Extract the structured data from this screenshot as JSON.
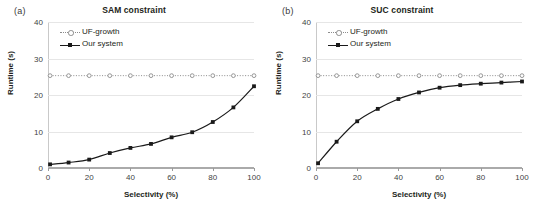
{
  "figure": {
    "panels": [
      {
        "tag": "(a)",
        "title": "SAM constraint",
        "legend": [
          {
            "label": "UF-growth",
            "style": "dotted-open"
          },
          {
            "label": "Our system",
            "style": "solid-filled"
          }
        ]
      },
      {
        "tag": "(b)",
        "title": "SUC constraint",
        "legend": [
          {
            "label": "UF-growth",
            "style": "dotted-open"
          },
          {
            "label": "Our system",
            "style": "solid-filled"
          }
        ]
      }
    ]
  },
  "chart_data": [
    {
      "type": "line",
      "title": "SAM constraint",
      "panel_tag": "(a)",
      "xlabel": "Selectivity (%)",
      "ylabel": "Runtime (s)",
      "xlim": [
        0,
        100
      ],
      "ylim": [
        0,
        40
      ],
      "xticks": [
        0,
        20,
        40,
        60,
        80,
        100
      ],
      "yticks": [
        0,
        10,
        20,
        30,
        40
      ],
      "grid": true,
      "legend_position": "upper-left-inside",
      "x": [
        1,
        10,
        20,
        30,
        40,
        50,
        60,
        70,
        80,
        90,
        100
      ],
      "series": [
        {
          "name": "UF-growth",
          "marker": "open-circle",
          "line": "dotted",
          "color": "#8c8c8c",
          "values": [
            25.3,
            25.3,
            25.3,
            25.3,
            25.3,
            25.3,
            25.3,
            25.3,
            25.3,
            25.3,
            25.3
          ]
        },
        {
          "name": "Our system",
          "marker": "filled-square",
          "line": "solid",
          "color": "#1a1a1a",
          "values": [
            1.0,
            1.5,
            2.3,
            4.1,
            5.5,
            6.6,
            8.4,
            9.8,
            12.6,
            16.6,
            22.4
          ]
        }
      ]
    },
    {
      "type": "line",
      "title": "SUC constraint",
      "panel_tag": "(b)",
      "xlabel": "Selectivity (%)",
      "ylabel": "Runtime (s)",
      "xlim": [
        0,
        100
      ],
      "ylim": [
        0,
        40
      ],
      "xticks": [
        0,
        20,
        40,
        60,
        80,
        100
      ],
      "yticks": [
        0,
        10,
        20,
        30,
        40
      ],
      "grid": true,
      "legend_position": "upper-left-inside",
      "x": [
        1,
        10,
        20,
        30,
        40,
        50,
        60,
        70,
        80,
        90,
        100
      ],
      "series": [
        {
          "name": "UF-growth",
          "marker": "open-circle",
          "line": "dotted",
          "color": "#8c8c8c",
          "values": [
            25.3,
            25.3,
            25.3,
            25.3,
            25.3,
            25.3,
            25.3,
            25.3,
            25.3,
            25.3,
            25.3
          ]
        },
        {
          "name": "Our system",
          "marker": "filled-square",
          "line": "solid",
          "color": "#1a1a1a",
          "values": [
            1.3,
            7.2,
            12.8,
            16.2,
            18.9,
            20.7,
            22.0,
            22.7,
            23.1,
            23.4,
            23.7
          ]
        }
      ]
    }
  ]
}
